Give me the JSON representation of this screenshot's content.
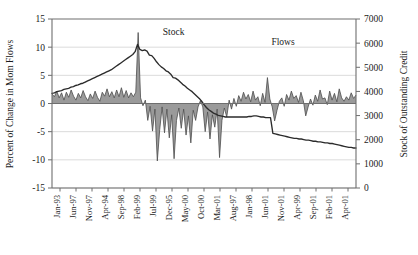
{
  "chart_data": {
    "type": "line",
    "title": "",
    "grid": true,
    "legend_position": "inline-annotations",
    "annotations": [
      {
        "text": "Stock",
        "x_frac": 0.4,
        "y_value": 12.2,
        "axis": "left"
      },
      {
        "text": "Flows",
        "x_frac": 0.76,
        "y_value": 10.3,
        "axis": "left"
      }
    ],
    "left_axis": {
      "label": "Percent of Change in Mom Flows",
      "ticks": [
        15,
        10,
        5,
        0,
        -5,
        -10,
        -15
      ],
      "tick_labels": [
        "15",
        "10",
        "5",
        "0",
        "-5",
        "-10",
        "-15"
      ],
      "ylim": [
        -15,
        15
      ]
    },
    "right_axis": {
      "label": "Stock of Outstanding Credit",
      "ticks": [
        7000,
        6000,
        5000,
        4000,
        3000,
        2000,
        1000,
        0
      ],
      "tick_labels": [
        "7000",
        "6000",
        "5000",
        "4000",
        "3000",
        "2000",
        "1000",
        "0"
      ],
      "ylim": [
        0,
        7000
      ]
    },
    "xlabel": "",
    "x_tick_labels": [
      "Jan-93",
      "Jun-97",
      "Nov-97",
      "Apr-94",
      "Sep-98",
      "Feb-99",
      "Jul-99",
      "Dec-95",
      "May-00",
      "Oct-00",
      "Mar-01",
      "Aug-97",
      "Jan-98",
      "Jun-01",
      "Nov-01",
      "Apr-99",
      "Sep-01",
      "Feb-01",
      "Apr-01"
    ],
    "series": [
      {
        "name": "Flows",
        "axis": "left",
        "style": "area-filled",
        "fill_color": "#9a9a9a",
        "line_color": "#4d4d4d",
        "unit": "percent",
        "values": [
          1.7,
          1.2,
          2.2,
          1.0,
          1.9,
          0.6,
          2.0,
          1.1,
          2.4,
          1.3,
          0.6,
          1.8,
          1.0,
          2.3,
          1.2,
          0.5,
          1.7,
          0.9,
          2.2,
          1.1,
          0.4,
          2.0,
          1.3,
          2.6,
          1.2,
          2.1,
          1.0,
          2.4,
          1.2,
          2.8,
          1.1,
          2.3,
          1.0,
          1.9,
          1.2,
          2.0,
          12.6,
          1.0,
          -0.4,
          0.6,
          -3.0,
          -0.5,
          -4.9,
          -1.0,
          -10.2,
          -4.6,
          -0.6,
          -5.2,
          -1.0,
          -6.1,
          -2.0,
          -9.8,
          -3.0,
          -0.8,
          -4.4,
          -1.0,
          -5.6,
          -2.2,
          -7.0,
          -1.2,
          -3.0,
          -0.6,
          0.5,
          -0.6,
          -5.0,
          -1.5,
          -6.3,
          -2.0,
          -4.2,
          -1.0,
          -9.6,
          -3.0,
          -0.8,
          -2.4,
          0.6,
          -1.0,
          0.9,
          -0.5,
          1.4,
          0.4,
          2.0,
          0.8,
          1.6,
          0.3,
          2.2,
          0.6,
          1.2,
          -0.4,
          1.8,
          0.2,
          4.6,
          0.8,
          -0.6,
          -3.1,
          -1.2,
          0.4,
          1.0,
          -0.5,
          1.6,
          0.6,
          2.2,
          0.9,
          1.4,
          0.2,
          2.0,
          0.5,
          -2.2,
          -0.6,
          0.8,
          -0.3,
          1.5,
          0.4,
          2.4,
          0.8,
          1.0,
          -0.2,
          2.2,
          0.6,
          1.8,
          0.3,
          2.6,
          1.0,
          0.4,
          1.2,
          0.6,
          1.9,
          0.9,
          1.5
        ]
      },
      {
        "name": "Stock",
        "axis": "right",
        "style": "line",
        "line_color": "#2b2b2b",
        "unit": "credit",
        "left_scale_values": [
          1.8,
          1.9,
          2.1,
          2.2,
          2.3,
          2.5,
          2.6,
          2.7,
          2.9,
          3.0,
          3.2,
          3.3,
          3.5,
          3.6,
          3.8,
          4.0,
          4.2,
          4.4,
          4.6,
          4.8,
          5.0,
          5.2,
          5.4,
          5.6,
          5.8,
          6.0,
          6.3,
          6.6,
          6.9,
          7.2,
          7.5,
          7.8,
          8.1,
          8.4,
          8.7,
          9.2,
          10.5,
          9.6,
          9.4,
          9.5,
          9.3,
          8.6,
          8.5,
          8.0,
          7.4,
          6.9,
          6.5,
          6.2,
          5.8,
          5.6,
          5.2,
          4.6,
          4.5,
          4.2,
          3.8,
          3.4,
          3.1,
          2.7,
          2.4,
          2.1,
          1.7,
          1.3,
          0.9,
          0.4,
          -0.2,
          -0.7,
          -1.1,
          -1.4,
          -1.7,
          -1.9,
          -2.1,
          -2.2,
          -2.3,
          -2.4,
          -2.4,
          -2.4,
          -2.4,
          -2.4,
          -2.4,
          -2.4,
          -2.4,
          -2.4,
          -2.4,
          -2.3,
          -2.3,
          -2.2,
          -2.2,
          -2.3,
          -2.4,
          -2.4,
          -2.5,
          -2.5,
          -2.5,
          -5.3,
          -5.4,
          -5.5,
          -5.6,
          -5.7,
          -5.8,
          -5.9,
          -6.0,
          -6.1,
          -6.2,
          -6.2,
          -6.3,
          -6.3,
          -6.4,
          -6.5,
          -6.5,
          -6.6,
          -6.7,
          -6.7,
          -6.8,
          -6.8,
          -6.9,
          -7.0,
          -7.0,
          -7.1,
          -7.1,
          -7.2,
          -7.3,
          -7.4,
          -7.5,
          -7.6,
          -7.7,
          -7.8,
          -7.8,
          -7.9,
          -7.9
        ]
      }
    ]
  },
  "colors": {
    "flow_fill": "#9a9a9a",
    "flow_line": "#4d4d4d",
    "stock_line": "#2b2b2b",
    "grid": "#d7d7d7",
    "axis": "#6e6e6e",
    "text": "#1a1a1a"
  }
}
